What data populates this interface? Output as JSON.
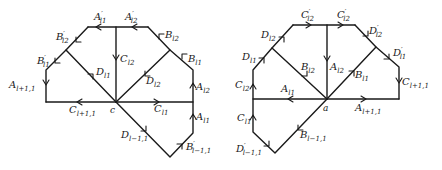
{
  "figure": {
    "left_diagram": {
      "center_vertex": "c",
      "labels": {
        "A_l1_prime": {
          "base": "A",
          "prime": "′",
          "sub": "l1"
        },
        "A_l2_prime": {
          "base": "A",
          "prime": "′",
          "sub": "l2"
        },
        "B_l2_prime": {
          "base": "B",
          "prime": "′",
          "sub": "l2"
        },
        "B_l1_prime": {
          "base": "B",
          "prime": "′",
          "sub": "l1"
        },
        "A_l+1,1": {
          "base": "A",
          "sub": "l+1,1"
        },
        "C_l+1,1": {
          "base": "C",
          "sub": "l+1,1"
        },
        "C_l2": {
          "base": "C",
          "sub": "l2"
        },
        "D_l1": {
          "base": "D",
          "sub": "l1"
        },
        "D_l2": {
          "base": "D",
          "sub": "l2"
        },
        "B_l2": {
          "base": "B",
          "sub": "l2"
        },
        "B_l1": {
          "base": "B",
          "sub": "l1"
        },
        "A_l2": {
          "base": "A",
          "sub": "l2"
        },
        "A_l1": {
          "base": "A",
          "sub": "l1"
        },
        "C_l1": {
          "base": "C",
          "sub": "l1"
        },
        "D_l-1,1": {
          "base": "D",
          "sub": "l−1,1"
        },
        "B_l-1,1_prime": {
          "base": "B",
          "prime": "′",
          "sub": "l−1,1"
        }
      }
    },
    "right_diagram": {
      "center_vertex": "a",
      "labels": {
        "C_l2_prime_left": {
          "base": "C",
          "prime": "′",
          "sub": "l2"
        },
        "C_l2_prime_right": {
          "base": "C",
          "prime": "′",
          "sub": "l2"
        },
        "D_l2": {
          "base": "D",
          "sub": "l2"
        },
        "D_l1": {
          "base": "D",
          "sub": "l1"
        },
        "D_l2_prime": {
          "base": "D",
          "prime": "′",
          "sub": "l2"
        },
        "D_l1_prime": {
          "base": "D",
          "prime": "′",
          "sub": "l1"
        },
        "B_l2": {
          "base": "B",
          "sub": "l2"
        },
        "A_l2": {
          "base": "A",
          "sub": "l2"
        },
        "B_l1": {
          "base": "B",
          "sub": "l1"
        },
        "C_l+1,1": {
          "base": "C",
          "sub": "l+1,1"
        },
        "C_l2": {
          "base": "C",
          "sub": "l2"
        },
        "A_l1": {
          "base": "A",
          "sub": "l1"
        },
        "A_l+1,1": {
          "base": "A",
          "sub": "l+1,1"
        },
        "C_l1": {
          "base": "C",
          "sub": "l1"
        },
        "B_l-1,1": {
          "base": "B",
          "sub": "l−1,1"
        },
        "D_l-1,1_prime": {
          "base": "D",
          "prime": "′",
          "sub": "l−1,1"
        }
      }
    }
  }
}
